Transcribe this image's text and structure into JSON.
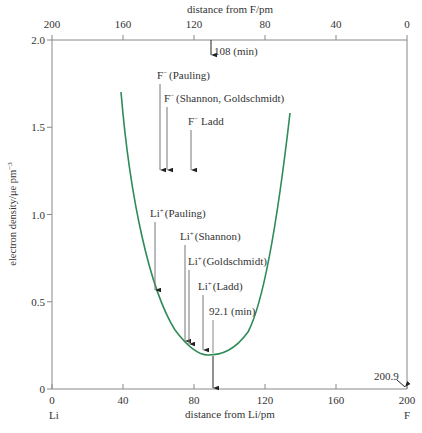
{
  "chart_data": {
    "type": "line",
    "title": "",
    "xlabel": "distance from Li/pm",
    "x2label": "distance from F/pm",
    "ylabel": "electron density/μe pm⁻³",
    "xlim": [
      0,
      200
    ],
    "ylim": [
      0,
      2.0
    ],
    "grid": false,
    "x_ticks": [
      "0",
      "40",
      "80",
      "120",
      "160",
      "200"
    ],
    "x2_ticks": [
      "200",
      "160",
      "120",
      "80",
      "40",
      "0"
    ],
    "y_ticks": [
      "0",
      "0.5",
      "1.0",
      "1.5",
      "2.0"
    ],
    "x_endpoint_labels": {
      "left": "Li",
      "right": "F"
    },
    "bond_length_label": "200.9",
    "series": [
      {
        "name": "electron density along Li–F internuclear axis",
        "color": "#2e8b57",
        "x": [
          38,
          45,
          52,
          60,
          68,
          76,
          84,
          90,
          96,
          104,
          112,
          120,
          128,
          134
        ],
        "y": [
          1.7,
          1.28,
          0.95,
          0.68,
          0.46,
          0.32,
          0.23,
          0.2,
          0.22,
          0.31,
          0.5,
          0.8,
          1.2,
          1.58
        ]
      }
    ],
    "annotations": [
      {
        "label": "108 (min)",
        "x_from_Li": 92.9,
        "axis": "top",
        "note": "minimum from F"
      },
      {
        "label": "F⁻ (Pauling)",
        "x": 61,
        "arrow_to_y": 1.25
      },
      {
        "label": "F⁻ (Shannon, Goldschmidt)",
        "x": 65,
        "arrow_to_y": 1.25
      },
      {
        "label": "F⁻ Ladd",
        "x": 78,
        "arrow_to_y": 1.25
      },
      {
        "label": "Li⁺ (Pauling)",
        "x": 58,
        "arrow_to_y": 0.57
      },
      {
        "label": "Li⁺ (Shannon)",
        "x": 75,
        "arrow_to_y": 0.27
      },
      {
        "label": "Li⁺ (Goldschmidt)",
        "x": 77,
        "arrow_to_y": 0.26
      },
      {
        "label": "Li⁺ (Ladd)",
        "x": 85,
        "arrow_to_y": 0.22
      },
      {
        "label": "92.1 (min)",
        "x": 92.1,
        "arrow_to_y": 0
      }
    ]
  },
  "labels": {
    "top_axis_title": "distance from F/pm",
    "bottom_axis_title": "distance from Li/pm",
    "y_axis_title": "electron density/μe pm",
    "y_axis_sup": "−3",
    "li": "Li",
    "f": "F",
    "bond_length": "200.9",
    "min_from_f": "108 (min)",
    "min_from_li": "92.1 (min)",
    "f_pauling_sym": "F",
    "f_sup": "−",
    "f_pauling": "(Pauling)",
    "f_shannon": "(Shannon, Goldschmidt)",
    "f_ladd": "Ladd",
    "li_sym": "Li",
    "li_sup": "+",
    "li_pauling": "(Pauling)",
    "li_shannon": "(Shannon)",
    "li_goldschmidt": "(Goldschmidt)",
    "li_ladd": "(Ladd)"
  }
}
